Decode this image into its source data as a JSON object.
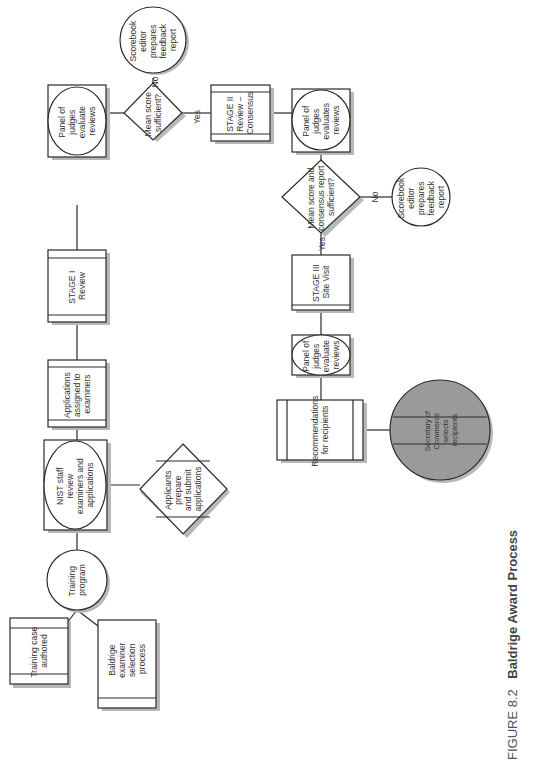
{
  "figure": {
    "caption_number": "FIGURE 8.2",
    "caption_title": "Baldrige Award Process",
    "orientation": "rotated 90° counter-clockwise"
  },
  "nodes": {
    "training_case": {
      "shape": "process",
      "lines": [
        "Training case",
        "authored"
      ]
    },
    "examiner_selection": {
      "shape": "process",
      "lines": [
        "Baldrige",
        "examiner",
        "selection",
        "process"
      ]
    },
    "training_program": {
      "shape": "circle",
      "lines": [
        "Training",
        "program"
      ]
    },
    "nist_staff": {
      "shape": "circle-in-box",
      "lines": [
        "NIST staff",
        "review",
        "examiners and",
        "applications"
      ]
    },
    "applicants": {
      "shape": "diamond",
      "lines": [
        "Applicants",
        "prepare",
        "and submit",
        "applications"
      ]
    },
    "applications_assigned": {
      "shape": "process",
      "lines": [
        "Applications",
        "assigned to",
        "examiners"
      ]
    },
    "stage1": {
      "shape": "process",
      "lines": [
        "STAGE I",
        "Review"
      ]
    },
    "panel1": {
      "shape": "circle-in-box",
      "lines": [
        "Panel of",
        "judges",
        "evaluate",
        "reviews"
      ]
    },
    "decision1": {
      "shape": "diamond",
      "lines": [
        "Mean score",
        "sufficient?"
      ]
    },
    "scorebook1": {
      "shape": "circle",
      "lines": [
        "Scorebook",
        "editor",
        "prepares",
        "feedback",
        "report"
      ]
    },
    "stage2": {
      "shape": "process",
      "lines": [
        "STAGE II",
        "Review –",
        "Consensus"
      ]
    },
    "panel2": {
      "shape": "circle-in-box",
      "lines": [
        "Panel of",
        "judges",
        "evaluates",
        "reviews"
      ]
    },
    "decision2": {
      "shape": "diamond",
      "lines": [
        "Mean score and",
        "consensus report",
        "sufficient?"
      ]
    },
    "scorebook2": {
      "shape": "circle",
      "lines": [
        "Scorebook",
        "editor",
        "prepares",
        "feedback",
        "report"
      ]
    },
    "stage3": {
      "shape": "process",
      "lines": [
        "STAGE III",
        "Site Visit"
      ]
    },
    "panel3": {
      "shape": "circle-in-box",
      "lines": [
        "Panel of",
        "judges",
        "evaluate",
        "reviews"
      ]
    },
    "recommendations": {
      "shape": "process",
      "lines": [
        "Recommendations",
        "for recipients"
      ]
    },
    "secretary": {
      "shape": "gray-circle",
      "lines": [
        "Secretary of",
        "Commerce",
        "selects",
        "recipients"
      ]
    }
  },
  "edge_labels": {
    "d1_no": "No",
    "d1_yes": "Yes",
    "d2_no": "No",
    "d2_yes": "Yes"
  },
  "colors": {
    "line": "#2a2a2a",
    "shadow": "#b8b8b8",
    "final_node_fill": "#9a9a9a",
    "background": "#ffffff"
  }
}
